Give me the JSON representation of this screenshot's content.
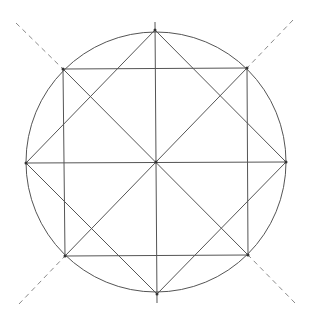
{
  "diagram": {
    "type": "geometric-construction",
    "colors": {
      "line": "#555555",
      "dashed": "#8a8a8a",
      "point": "#333333",
      "background": "#ffffff"
    },
    "circle": {
      "cx": 156,
      "cy": 162,
      "r": 130
    },
    "diamond": {
      "points": [
        [
          155,
          30
        ],
        [
          286,
          162
        ],
        [
          157,
          294
        ],
        [
          26,
          163
        ]
      ]
    },
    "square": {
      "points": [
        [
          63,
          69
        ],
        [
          247,
          68
        ],
        [
          248,
          255
        ],
        [
          65,
          256
        ]
      ]
    },
    "vertical_axis": {
      "x1": 155,
      "y1": 22,
      "x2": 157,
      "y2": 303
    },
    "horizontal_axis": {
      "x1": 26,
      "y1": 163,
      "x2": 286,
      "y2": 162
    },
    "diagonals": [
      {
        "x1": 63,
        "y1": 69,
        "x2": 248,
        "y2": 255
      },
      {
        "x1": 247,
        "y1": 68,
        "x2": 65,
        "y2": 256
      }
    ],
    "square_edge_cross_lines": [
      {
        "x1": 155,
        "y1": 30,
        "x2": 26,
        "y2": 163
      },
      {
        "x1": 155,
        "y1": 30,
        "x2": 286,
        "y2": 162
      }
    ],
    "dashed_extensions": [
      {
        "x1": 16,
        "y1": 23,
        "x2": 63,
        "y2": 69
      },
      {
        "x1": 293,
        "y1": 20,
        "x2": 247,
        "y2": 68
      },
      {
        "x1": 19,
        "y1": 304,
        "x2": 65,
        "y2": 256
      },
      {
        "x1": 295,
        "y1": 303,
        "x2": 248,
        "y2": 255
      }
    ]
  }
}
